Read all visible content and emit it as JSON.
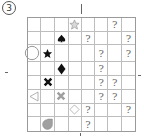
{
  "puzzle": {
    "number_label": "3",
    "rows": 8,
    "cols": 8,
    "question_mark": "?",
    "cells": [
      [
        "",
        "",
        "",
        "star-outline",
        "",
        "",
        "?",
        ""
      ],
      [
        "",
        "",
        "spade",
        "",
        "?",
        "",
        "",
        "?"
      ],
      [
        "circle-outline",
        "star-filled",
        "",
        "",
        "",
        "?",
        "",
        "?"
      ],
      [
        "",
        "",
        "diamond-filled",
        "",
        "",
        "?",
        "",
        ""
      ],
      [
        "",
        "cross-filled",
        "",
        "",
        "",
        "?",
        "?",
        ""
      ],
      [
        "triangle-left-outline",
        "",
        "cross-gray",
        "",
        "",
        "?",
        "?",
        ""
      ],
      [
        "",
        "",
        "",
        "diamond-outline",
        "?",
        "",
        "",
        "?"
      ],
      [
        "",
        "drop-gray",
        "",
        "",
        "?",
        "",
        "",
        ""
      ]
    ],
    "colors": {
      "grid_line": "#bdbdbd",
      "symbol_black": "#111111",
      "symbol_gray": "#a0a0a0",
      "outline_gray": "#999999"
    }
  }
}
